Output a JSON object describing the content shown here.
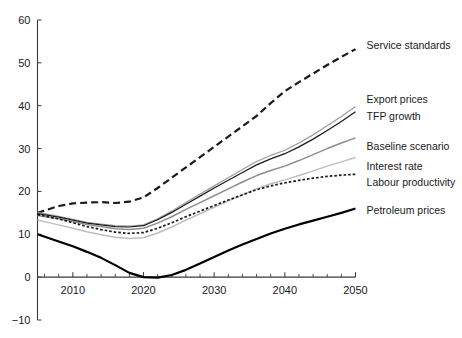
{
  "chart_data": {
    "type": "line",
    "title": "",
    "subtitle": "",
    "xlabel": "",
    "ylabel": "",
    "xlim": [
      2005,
      2050
    ],
    "ylim": [
      -10,
      60
    ],
    "y_ticks": [
      -10,
      0,
      10,
      20,
      30,
      40,
      50,
      60
    ],
    "y_tick_labels": [
      "−10",
      "0",
      "10",
      "20",
      "30",
      "40",
      "50",
      "60"
    ],
    "x_ticks": [
      2010,
      2020,
      2030,
      2040,
      2050
    ],
    "x_tick_labels": [
      "2010",
      "2020",
      "2030",
      "2040",
      "2050"
    ],
    "x_minor_step": 2,
    "grid": false,
    "legend_position": "right-inline-labels",
    "x": [
      2005,
      2008,
      2010,
      2012,
      2014,
      2016,
      2018,
      2020,
      2022,
      2024,
      2026,
      2028,
      2030,
      2032,
      2034,
      2036,
      2038,
      2040,
      2042,
      2044,
      2046,
      2048,
      2050
    ],
    "series": [
      {
        "name": "Service standards",
        "label": "Service standards",
        "color": "#1a1a1a",
        "style": "dashed-long",
        "width": 2.2,
        "label_x": 2051,
        "label_y": 54,
        "values": [
          15.0,
          16.6,
          17.2,
          17.4,
          17.5,
          17.3,
          17.6,
          18.6,
          20.8,
          23.2,
          25.6,
          28.0,
          30.4,
          32.8,
          35.2,
          37.6,
          40.6,
          43.4,
          45.5,
          47.5,
          49.5,
          51.4,
          53.2
        ]
      },
      {
        "name": "Export prices",
        "label": "Export prices",
        "color": "#9a9a9a",
        "style": "solid",
        "width": 1.2,
        "label_x": 2051,
        "label_y": 41.5,
        "values": [
          15.1,
          14.2,
          13.5,
          12.8,
          12.4,
          12.0,
          11.9,
          12.2,
          13.6,
          15.4,
          17.4,
          19.4,
          21.3,
          23.2,
          25.1,
          27.0,
          28.4,
          29.6,
          31.3,
          33.2,
          35.3,
          37.5,
          39.8
        ]
      },
      {
        "name": "TFP growth",
        "label": "TFP growth",
        "color": "#1a1a1a",
        "style": "solid",
        "width": 1.25,
        "label_x": 2051,
        "label_y": 37.5,
        "values": [
          14.8,
          14.0,
          13.3,
          12.6,
          12.2,
          11.8,
          11.7,
          12.0,
          13.4,
          15.1,
          17.0,
          18.9,
          20.8,
          22.6,
          24.4,
          26.2,
          27.6,
          28.8,
          30.4,
          32.2,
          34.2,
          36.3,
          38.6
        ]
      },
      {
        "name": "Baseline scenario",
        "label": "Baseline scenario",
        "color": "#8d8d8d",
        "style": "solid",
        "width": 1.5,
        "label_x": 2051,
        "label_y": 30.5,
        "values": [
          14.4,
          13.6,
          13.0,
          12.3,
          11.8,
          11.3,
          11.1,
          11.4,
          12.6,
          14.1,
          15.8,
          17.4,
          19.0,
          20.6,
          22.2,
          23.7,
          24.9,
          25.9,
          27.2,
          28.6,
          30.0,
          31.3,
          32.5
        ]
      },
      {
        "name": "Interest rate",
        "label": "Interest rate",
        "color": "#bdbdbd",
        "style": "solid",
        "width": 1.5,
        "label_x": 2051,
        "label_y": 25.8,
        "values": [
          13.3,
          12.2,
          11.4,
          10.6,
          9.9,
          9.3,
          9.0,
          9.2,
          10.3,
          11.7,
          13.3,
          14.8,
          16.3,
          17.8,
          19.2,
          20.6,
          21.8,
          22.7,
          23.7,
          24.8,
          25.9,
          26.9,
          27.9
        ]
      },
      {
        "name": "Labour productivity",
        "label": "Labour productivity",
        "color": "#1a1a1a",
        "style": "dotted-short",
        "width": 1.7,
        "label_x": 2051,
        "label_y": 22.0,
        "values": [
          14.6,
          13.6,
          12.7,
          11.8,
          11.1,
          10.5,
          10.2,
          10.4,
          11.4,
          12.7,
          14.1,
          15.4,
          16.7,
          18.0,
          19.2,
          20.4,
          21.3,
          22.0,
          22.6,
          23.1,
          23.5,
          23.8,
          24.0
        ]
      },
      {
        "name": "Petroleum prices",
        "label": "Petroleum prices",
        "color": "#000000",
        "style": "solid",
        "width": 2.2,
        "label_x": 2051,
        "label_y": 15.5,
        "values": [
          10.0,
          8.3,
          7.2,
          5.9,
          4.5,
          2.8,
          1.0,
          0.0,
          -0.1,
          0.5,
          1.7,
          3.2,
          4.7,
          6.2,
          7.6,
          8.9,
          10.2,
          11.3,
          12.3,
          13.2,
          14.1,
          15.0,
          16.0
        ]
      }
    ]
  },
  "axes": {
    "y_axis_name": "value-axis",
    "x_axis_name": "year-axis"
  }
}
